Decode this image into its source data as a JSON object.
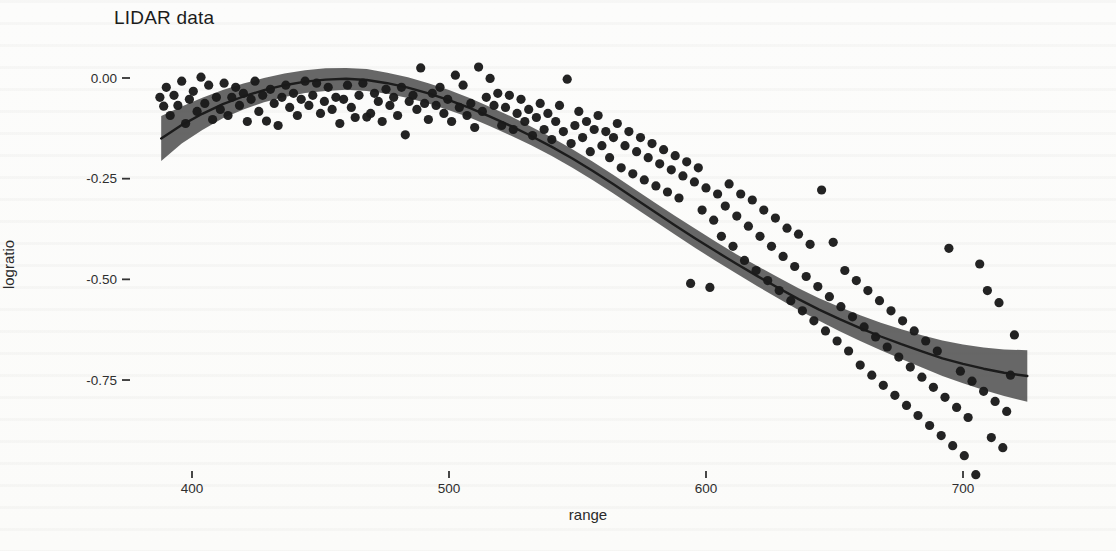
{
  "chart_data": {
    "type": "scatter",
    "title": "LIDAR data",
    "xlabel": "range",
    "ylabel": "logratio",
    "x_ticks": [
      400,
      500,
      600,
      700
    ],
    "y_ticks": [
      {
        "value": 0.0,
        "label": "0.00"
      },
      {
        "value": -0.25,
        "label": "-0.25"
      },
      {
        "value": -0.5,
        "label": "-0.50"
      },
      {
        "value": -0.75,
        "label": "-0.75"
      }
    ],
    "xlim": [
      385,
      731
    ],
    "ylim": [
      -1.01,
      0.09
    ],
    "grid": false,
    "legend": "none",
    "point_color": "#1a1a1a",
    "band_color": "#565656",
    "line_color": "#1c1c1c",
    "points": [
      [
        387.5,
        -0.048
      ],
      [
        389,
        -0.07
      ],
      [
        390,
        -0.023
      ],
      [
        391.5,
        -0.093
      ],
      [
        393,
        -0.043
      ],
      [
        394.5,
        -0.068
      ],
      [
        396,
        -0.008
      ],
      [
        397.5,
        -0.113
      ],
      [
        399,
        -0.053
      ],
      [
        400.5,
        -0.033
      ],
      [
        402,
        -0.083
      ],
      [
        403.5,
        0.002
      ],
      [
        405,
        -0.063
      ],
      [
        406.5,
        -0.018
      ],
      [
        408,
        -0.103
      ],
      [
        409.5,
        -0.048
      ],
      [
        411,
        -0.078
      ],
      [
        412.5,
        -0.013
      ],
      [
        414,
        -0.093
      ],
      [
        415.5,
        -0.048
      ],
      [
        417,
        -0.023
      ],
      [
        418.5,
        -0.068
      ],
      [
        420,
        -0.038
      ],
      [
        421.5,
        -0.108
      ],
      [
        423,
        -0.053
      ],
      [
        424.5,
        -0.008
      ],
      [
        426,
        -0.083
      ],
      [
        427.5,
        -0.043
      ],
      [
        429,
        -0.107
      ],
      [
        430.5,
        -0.028
      ],
      [
        432,
        -0.063
      ],
      [
        433.5,
        -0.118
      ],
      [
        435,
        -0.048
      ],
      [
        436.5,
        -0.018
      ],
      [
        438,
        -0.073
      ],
      [
        439.5,
        -0.038
      ],
      [
        441,
        -0.093
      ],
      [
        442.5,
        -0.053
      ],
      [
        444,
        -0.008
      ],
      [
        445.5,
        -0.068
      ],
      [
        447,
        -0.043
      ],
      [
        448.5,
        -0.013
      ],
      [
        450,
        -0.088
      ],
      [
        451.5,
        -0.058
      ],
      [
        453,
        -0.023
      ],
      [
        454.5,
        -0.078
      ],
      [
        456,
        -0.048
      ],
      [
        457.5,
        -0.113
      ],
      [
        459,
        -0.053
      ],
      [
        460.5,
        -0.018
      ],
      [
        462,
        -0.073
      ],
      [
        463.5,
        -0.098
      ],
      [
        465,
        -0.043
      ],
      [
        466.5,
        -0.013
      ],
      [
        468,
        -0.097
      ],
      [
        469.5,
        -0.088
      ],
      [
        471,
        -0.038
      ],
      [
        472.5,
        -0.058
      ],
      [
        474,
        -0.108
      ],
      [
        475.5,
        -0.028
      ],
      [
        477,
        -0.068
      ],
      [
        478.5,
        -0.048
      ],
      [
        480,
        -0.093
      ],
      [
        481.5,
        -0.023
      ],
      [
        483,
        -0.141
      ],
      [
        484.5,
        -0.058
      ],
      [
        486,
        -0.043
      ],
      [
        487.5,
        -0.078
      ],
      [
        489,
        0.025
      ],
      [
        490.5,
        -0.063
      ],
      [
        492,
        -0.103
      ],
      [
        493.5,
        -0.038
      ],
      [
        495,
        -0.068
      ],
      [
        496.5,
        -0.023
      ],
      [
        498,
        -0.088
      ],
      [
        499.5,
        -0.053
      ],
      [
        501,
        -0.108
      ],
      [
        502.5,
        0.007
      ],
      [
        504,
        -0.073
      ],
      [
        505.5,
        -0.018
      ],
      [
        507,
        -0.093
      ],
      [
        508.5,
        -0.063
      ],
      [
        510,
        -0.123
      ],
      [
        511.5,
        0.027
      ],
      [
        513,
        -0.083
      ],
      [
        514.5,
        -0.048
      ],
      [
        516,
        -0.001
      ],
      [
        517.5,
        -0.068
      ],
      [
        519,
        -0.038
      ],
      [
        520.5,
        -0.118
      ],
      [
        522,
        -0.073
      ],
      [
        523.5,
        -0.043
      ],
      [
        525,
        -0.128
      ],
      [
        526.5,
        -0.088
      ],
      [
        528,
        -0.053
      ],
      [
        529.5,
        -0.108
      ],
      [
        531,
        -0.078
      ],
      [
        532.5,
        -0.143
      ],
      [
        534,
        -0.098
      ],
      [
        535.5,
        -0.063
      ],
      [
        537,
        -0.128
      ],
      [
        538.5,
        -0.088
      ],
      [
        540,
        -0.153
      ],
      [
        541.5,
        -0.108
      ],
      [
        543,
        -0.068
      ],
      [
        544.5,
        -0.133
      ],
      [
        546,
        -0.003
      ],
      [
        547.5,
        -0.163
      ],
      [
        549,
        -0.118
      ],
      [
        550.5,
        -0.083
      ],
      [
        552,
        -0.148
      ],
      [
        553.5,
        -0.108
      ],
      [
        555,
        -0.183
      ],
      [
        556.5,
        -0.128
      ],
      [
        558,
        -0.093
      ],
      [
        559.5,
        -0.168
      ],
      [
        561,
        -0.133
      ],
      [
        562.5,
        -0.198
      ],
      [
        564,
        -0.148
      ],
      [
        565.5,
        -0.113
      ],
      [
        567,
        -0.223
      ],
      [
        568.5,
        -0.168
      ],
      [
        570,
        -0.133
      ],
      [
        571.5,
        -0.238
      ],
      [
        573,
        -0.183
      ],
      [
        574.5,
        -0.148
      ],
      [
        576,
        -0.253
      ],
      [
        577.5,
        -0.198
      ],
      [
        579,
        -0.163
      ],
      [
        580.5,
        -0.268
      ],
      [
        582,
        -0.213
      ],
      [
        583.5,
        -0.178
      ],
      [
        585,
        -0.283
      ],
      [
        586.5,
        -0.228
      ],
      [
        588,
        -0.193
      ],
      [
        589.5,
        -0.298
      ],
      [
        591,
        -0.243
      ],
      [
        592.5,
        -0.208
      ],
      [
        594,
        -0.51
      ],
      [
        595.5,
        -0.258
      ],
      [
        597,
        -0.223
      ],
      [
        598.5,
        -0.328
      ],
      [
        600,
        -0.273
      ],
      [
        601.5,
        -0.52
      ],
      [
        603,
        -0.353
      ],
      [
        604.5,
        -0.288
      ],
      [
        606,
        -0.393
      ],
      [
        607.5,
        -0.318
      ],
      [
        609,
        -0.263
      ],
      [
        610.5,
        -0.418
      ],
      [
        612,
        -0.343
      ],
      [
        613.5,
        -0.288
      ],
      [
        615,
        -0.453
      ],
      [
        616.5,
        -0.368
      ],
      [
        618,
        -0.303
      ],
      [
        619.5,
        -0.478
      ],
      [
        621,
        -0.393
      ],
      [
        622.5,
        -0.328
      ],
      [
        624,
        -0.503
      ],
      [
        625.5,
        -0.418
      ],
      [
        627,
        -0.348
      ],
      [
        628.5,
        -0.528
      ],
      [
        630,
        -0.443
      ],
      [
        631.5,
        -0.373
      ],
      [
        633,
        -0.553
      ],
      [
        634.5,
        -0.468
      ],
      [
        636,
        -0.388
      ],
      [
        637.5,
        -0.578
      ],
      [
        639,
        -0.493
      ],
      [
        640.5,
        -0.413
      ],
      [
        642,
        -0.603
      ],
      [
        643.5,
        -0.518
      ],
      [
        645,
        -0.278
      ],
      [
        646.5,
        -0.628
      ],
      [
        648,
        -0.543
      ],
      [
        649.5,
        -0.408
      ],
      [
        651,
        -0.653
      ],
      [
        652.5,
        -0.568
      ],
      [
        654,
        -0.478
      ],
      [
        655.5,
        -0.678
      ],
      [
        657,
        -0.593
      ],
      [
        658.5,
        -0.503
      ],
      [
        660,
        -0.713
      ],
      [
        661.5,
        -0.618
      ],
      [
        663,
        -0.528
      ],
      [
        664.5,
        -0.738
      ],
      [
        666,
        -0.643
      ],
      [
        667.5,
        -0.553
      ],
      [
        669,
        -0.763
      ],
      [
        670.5,
        -0.668
      ],
      [
        672,
        -0.578
      ],
      [
        673.5,
        -0.788
      ],
      [
        675,
        -0.693
      ],
      [
        676.5,
        -0.603
      ],
      [
        678,
        -0.813
      ],
      [
        679.5,
        -0.718
      ],
      [
        681,
        -0.628
      ],
      [
        682.5,
        -0.838
      ],
      [
        684,
        -0.743
      ],
      [
        685.5,
        -0.653
      ],
      [
        687,
        -0.863
      ],
      [
        688.5,
        -0.768
      ],
      [
        690,
        -0.678
      ],
      [
        691.5,
        -0.888
      ],
      [
        693,
        -0.793
      ],
      [
        694.5,
        -0.423
      ],
      [
        696,
        -0.913
      ],
      [
        697.5,
        -0.818
      ],
      [
        699,
        -0.728
      ],
      [
        700.5,
        -0.938
      ],
      [
        702,
        -0.843
      ],
      [
        703.5,
        -0.753
      ],
      [
        705,
        -0.985
      ],
      [
        706.5,
        -0.462
      ],
      [
        708,
        -0.778
      ],
      [
        709.5,
        -0.528
      ],
      [
        711,
        -0.893
      ],
      [
        712.5,
        -0.803
      ],
      [
        714,
        -0.558
      ],
      [
        715.5,
        -0.918
      ],
      [
        717,
        -0.828
      ],
      [
        718.5,
        -0.738
      ],
      [
        720,
        -0.638
      ]
    ],
    "smooth": {
      "x": [
        388,
        396,
        404,
        412,
        420,
        428,
        436,
        444,
        452,
        460,
        468,
        476,
        484,
        492,
        500,
        508,
        516,
        524,
        532,
        540,
        548,
        556,
        564,
        572,
        580,
        588,
        596,
        604,
        612,
        620,
        628,
        636,
        644,
        652,
        660,
        668,
        676,
        684,
        692,
        700,
        708,
        716,
        725
      ],
      "fit": [
        -0.15,
        -0.117,
        -0.089,
        -0.065,
        -0.046,
        -0.03,
        -0.018,
        -0.009,
        -0.004,
        -0.002,
        -0.005,
        -0.013,
        -0.024,
        -0.038,
        -0.055,
        -0.074,
        -0.096,
        -0.119,
        -0.144,
        -0.171,
        -0.2,
        -0.231,
        -0.264,
        -0.298,
        -0.332,
        -0.366,
        -0.399,
        -0.431,
        -0.462,
        -0.492,
        -0.521,
        -0.549,
        -0.575,
        -0.599,
        -0.621,
        -0.642,
        -0.661,
        -0.679,
        -0.696,
        -0.71,
        -0.722,
        -0.732,
        -0.74
      ],
      "half_width": [
        0.056,
        0.046,
        0.04,
        0.035,
        0.032,
        0.03,
        0.029,
        0.028,
        0.028,
        0.027,
        0.027,
        0.026,
        0.026,
        0.025,
        0.025,
        0.024,
        0.024,
        0.024,
        0.023,
        0.023,
        0.023,
        0.023,
        0.023,
        0.023,
        0.023,
        0.023,
        0.024,
        0.024,
        0.024,
        0.025,
        0.026,
        0.027,
        0.028,
        0.03,
        0.032,
        0.034,
        0.037,
        0.04,
        0.044,
        0.048,
        0.053,
        0.058,
        0.064
      ]
    }
  }
}
